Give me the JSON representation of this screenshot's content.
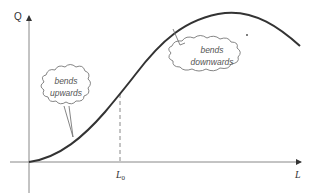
{
  "diagram": {
    "type": "curve-with-annotations",
    "axes": {
      "y_label": "Q",
      "x_label": "L",
      "x_marker_label_main": "L",
      "x_marker_label_sub": "0"
    },
    "callouts": [
      {
        "id": "left",
        "line1": "bends",
        "line2": "upwards"
      },
      {
        "id": "right",
        "line1": "bends",
        "line2": "downwards"
      }
    ],
    "colors": {
      "curve": "#333333",
      "axis": "#888888",
      "dashed": "#888888",
      "callout_stroke": "#777777",
      "text": "#555555"
    }
  }
}
